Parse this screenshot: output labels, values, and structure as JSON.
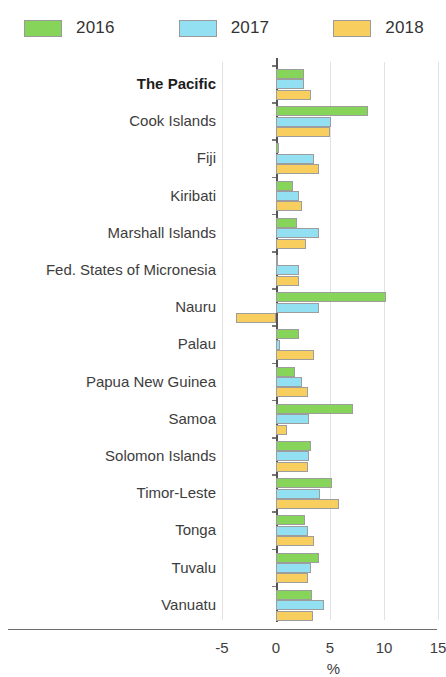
{
  "legend": {
    "items": [
      {
        "label": "2016",
        "color": "#86D45A",
        "icon": "legend-swatch"
      },
      {
        "label": "2017",
        "color": "#93E0F2",
        "icon": "legend-swatch"
      },
      {
        "label": "2018",
        "color": "#F8CE5F",
        "icon": "legend-swatch"
      }
    ]
  },
  "axis": {
    "ticks": [
      "-5",
      "0",
      "5",
      "10",
      "15"
    ],
    "title": "%"
  },
  "chart_data": {
    "type": "bar",
    "orientation": "horizontal",
    "title": "",
    "xlabel": "%",
    "ylabel": "",
    "xlim": [
      -5,
      15
    ],
    "xticks": [
      -5,
      0,
      5,
      10,
      15
    ],
    "grid": true,
    "legend_position": "top-left",
    "categories": [
      "The Pacific",
      "Cook Islands",
      "Fiji",
      "Kiribati",
      "Marshall Islands",
      "Fed. States of Micronesia",
      "Nauru",
      "Palau",
      "Papua New Guinea",
      "Samoa",
      "Solomon Islands",
      "Timor-Leste",
      "Tonga",
      "Tuvalu",
      "Vanuatu"
    ],
    "highlighted_category": "The Pacific",
    "series": [
      {
        "name": "2016",
        "color": "#86D45A",
        "values": [
          2.6,
          8.5,
          0.3,
          1.6,
          1.9,
          0.1,
          10.2,
          2.1,
          1.8,
          7.1,
          3.2,
          5.2,
          2.7,
          4.0,
          3.3
        ]
      },
      {
        "name": "2017",
        "color": "#93E0F2",
        "values": [
          2.6,
          5.1,
          3.5,
          2.1,
          4.0,
          2.1,
          4.0,
          0.4,
          2.4,
          3.1,
          3.1,
          4.1,
          3.0,
          3.2,
          4.4
        ]
      },
      {
        "name": "2018",
        "color": "#F8CE5F",
        "values": [
          3.2,
          5.0,
          4.0,
          2.4,
          2.8,
          2.1,
          -3.7,
          3.5,
          3.0,
          1.0,
          3.0,
          5.8,
          3.5,
          3.0,
          3.4
        ]
      }
    ]
  }
}
